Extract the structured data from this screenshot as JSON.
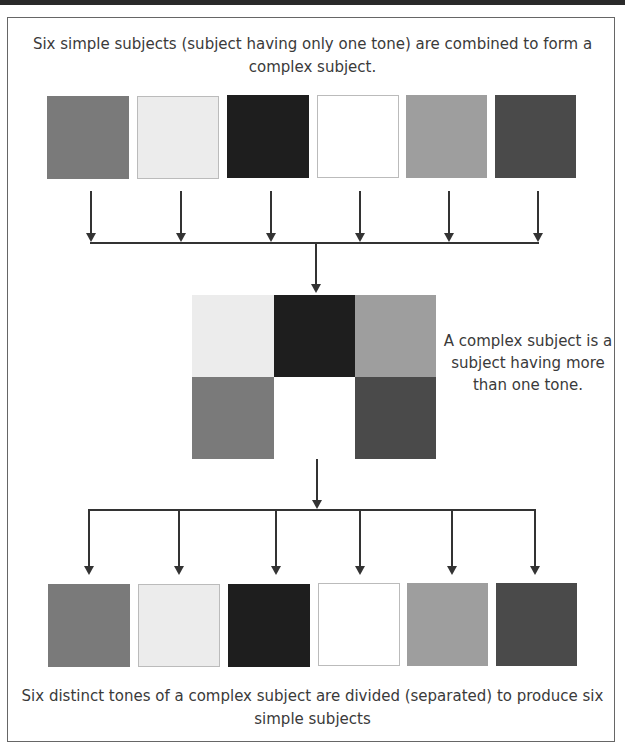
{
  "captions": {
    "top": "Six simple subjects (subject having only one tone) are combined to form a complex subject.",
    "side": "A complex subject is a subject having more than one tone.",
    "bottom": "Six distinct tones of a complex subject are divided (separated) to produce six simple subjects"
  },
  "tones": [
    {
      "name": "medium-gray",
      "color": "#7a7a7a"
    },
    {
      "name": "light-gray",
      "color": "#ececec"
    },
    {
      "name": "black",
      "color": "#1e1e1e"
    },
    {
      "name": "white",
      "color": "#ffffff"
    },
    {
      "name": "light-medium-gray",
      "color": "#9e9e9e"
    },
    {
      "name": "dark-gray",
      "color": "#4a4a4a"
    }
  ],
  "complex_grid": [
    [
      "light-gray",
      "black",
      "light-medium-gray"
    ],
    [
      "medium-gray",
      "white",
      "dark-gray"
    ]
  ]
}
